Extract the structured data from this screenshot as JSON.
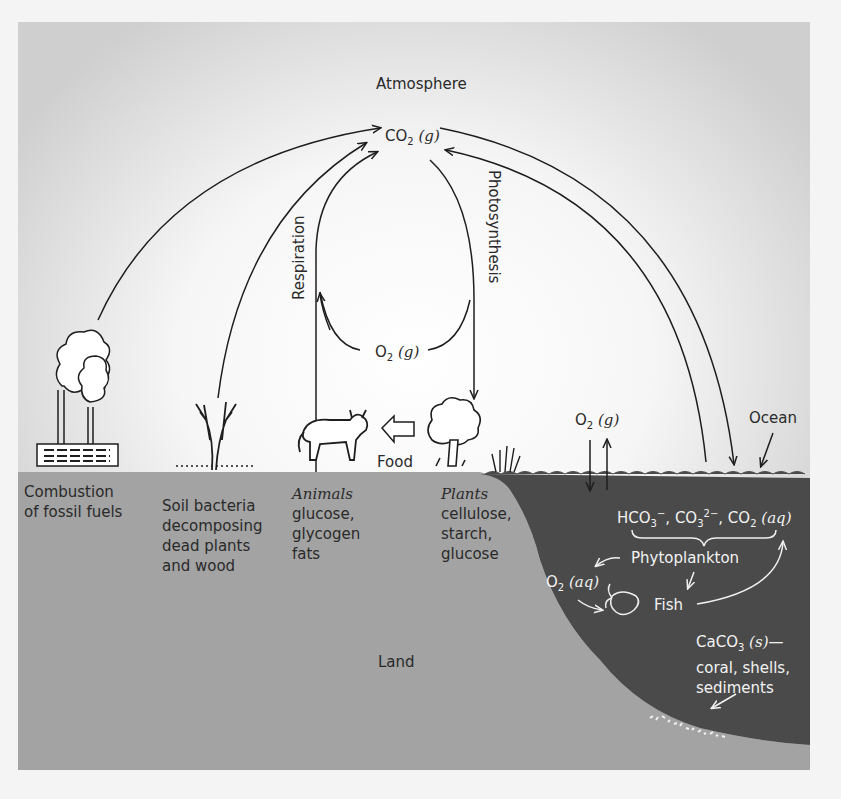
{
  "diagram": {
    "title": "Atmosphere",
    "co2_gas": {
      "main": "CO",
      "sub": "2",
      "state": "(g)"
    },
    "o2_gas_center": {
      "main": "O",
      "sub": "2",
      "state": "(g)"
    },
    "o2_gas_ocean": {
      "main": "O",
      "sub": "2",
      "state": "(g)"
    },
    "respiration": "Respiration",
    "photosynthesis": "Photosynthesis",
    "food": "Food",
    "ocean": "Ocean",
    "land": "Land",
    "sources": [
      {
        "id": "fossil",
        "lines": [
          "Combustion",
          "of fossil fuels"
        ]
      },
      {
        "id": "soil",
        "lines": [
          "Soil bacteria",
          "decomposing",
          "dead plants",
          "and wood"
        ]
      },
      {
        "id": "animals",
        "title": "Animals",
        "lines": [
          "glucose,",
          "glycogen",
          "fats"
        ]
      },
      {
        "id": "plants",
        "title": "Plants",
        "lines": [
          "cellulose,",
          "starch,",
          "glucose"
        ]
      }
    ],
    "ocean_species": {
      "hco3": "HCO",
      "hco3_sub": "3",
      "hco3_sup": "−",
      "co3": "CO",
      "co3_sub": "3",
      "co3_sup": "2−",
      "co2": "CO",
      "co2_sub": "2",
      "co2_state": "(aq)",
      "sep": ","
    },
    "phytoplankton": "Phytoplankton",
    "o2_aq": {
      "main": "O",
      "sub": "2",
      "state": "(aq)"
    },
    "fish": "Fish",
    "caco3": {
      "main": "CaCO",
      "sub": "3",
      "state": "(s)",
      "dash": "—"
    },
    "caco3_lines": [
      "coral, shells,",
      "sediments"
    ],
    "colors": {
      "land": "#a3a3a3",
      "ocean": "#4a4a4a",
      "sky_center": "#ffffff",
      "sky_edge": "#cfcfcf",
      "line": "#1e1e1e",
      "ocean_text": "#f0f0f0"
    }
  }
}
